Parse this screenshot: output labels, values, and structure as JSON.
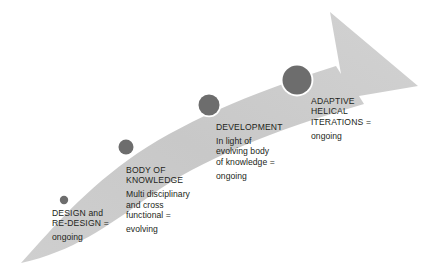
{
  "diagram": {
    "type": "curved-arrow-process-diagram",
    "colors": {
      "arrow_band": "#cccccc",
      "arrow_band_light": "#d6d6d6",
      "milestone_fill": "#6d6d6d",
      "milestone_ring": "#ffffff",
      "text": "#231f20",
      "background": "#ffffff"
    },
    "arrow": {
      "name": "process-arrow",
      "direction": "bottom-left to top-right",
      "head_position": "top-right"
    },
    "milestones": [
      {
        "id": "design",
        "marker_name": "milestone-dot-design",
        "cx": 64,
        "cy": 200,
        "r": 4.2,
        "title": "DESIGN and\nRE-DESIGN =",
        "description": "",
        "status": "ongoing"
      },
      {
        "id": "body-of-knowledge",
        "marker_name": "milestone-dot-body-of-knowledge",
        "cx": 126,
        "cy": 147,
        "r": 7.5,
        "title": "BODY OF\nKNOWLEDGE",
        "description": "Multi disciplinary\nand cross\nfunctional =",
        "status": "evolving"
      },
      {
        "id": "development",
        "marker_name": "milestone-dot-development",
        "cx": 209,
        "cy": 105,
        "r": 10.5,
        "title": "DEVELOPMENT",
        "description": "In light of\nevolving body\nof knowledge =",
        "status": "ongoing"
      },
      {
        "id": "adaptive-helical-iterations",
        "marker_name": "milestone-dot-adaptive-helical-iterations",
        "cx": 297,
        "cy": 80,
        "r": 14.5,
        "title": "ADAPTIVE\nHELICAL\nITERATIONS =",
        "description": "",
        "status": "ongoing"
      }
    ]
  }
}
